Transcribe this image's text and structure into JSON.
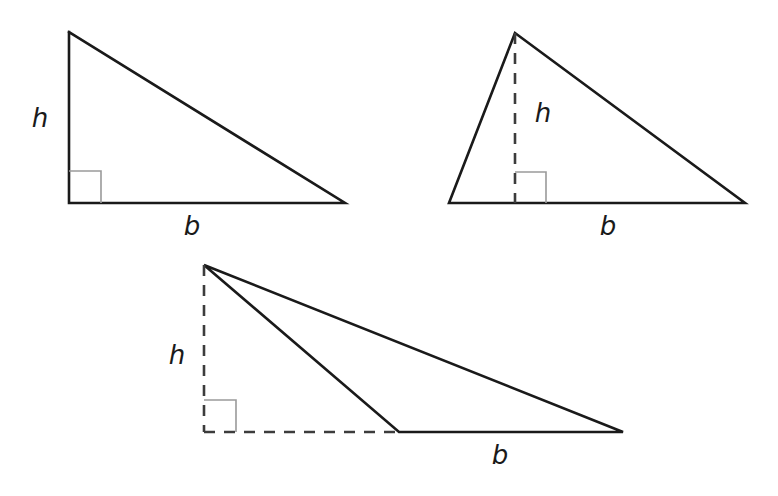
{
  "figure": {
    "background_color": "#ffffff",
    "stroke_color": "#1a1a1a",
    "dashed_color": "#3c3c3c",
    "right_angle_color": "#9a9a9a",
    "stroke_width": 2.6,
    "label_font_size": 26
  },
  "shapes": [
    {
      "id": "triangle-right",
      "name": "right-triangle",
      "type": "triangle",
      "variant": "right",
      "vertices": [
        {
          "x": 69,
          "y": 32
        },
        {
          "x": 69,
          "y": 203
        },
        {
          "x": 345,
          "y": 203
        }
      ],
      "height_segment": {
        "style": "solid",
        "from": {
          "x": 69,
          "y": 32
        },
        "to": {
          "x": 69,
          "y": 203
        }
      },
      "base_segment": {
        "style": "solid",
        "from": {
          "x": 69,
          "y": 203
        },
        "to": {
          "x": 345,
          "y": 203
        }
      },
      "right_angle_marker": {
        "x": 69,
        "y": 171,
        "size": 32
      },
      "height_label": {
        "text": "h",
        "x": 40,
        "y": 127
      },
      "base_label": {
        "text": "b",
        "x": 192,
        "y": 235
      }
    },
    {
      "id": "triangle-acute",
      "name": "acute-triangle",
      "type": "triangle",
      "variant": "acute",
      "vertices": [
        {
          "x": 515,
          "y": 33
        },
        {
          "x": 449,
          "y": 203
        },
        {
          "x": 745,
          "y": 203
        }
      ],
      "height_segment": {
        "style": "dashed",
        "from": {
          "x": 515,
          "y": 33
        },
        "to": {
          "x": 515,
          "y": 203
        }
      },
      "base_segment": {
        "style": "solid",
        "from": {
          "x": 449,
          "y": 203
        },
        "to": {
          "x": 745,
          "y": 203
        }
      },
      "right_angle_marker": {
        "x": 515,
        "y": 172,
        "size": 31
      },
      "height_label": {
        "text": "h",
        "x": 543,
        "y": 122
      },
      "base_label": {
        "text": "b",
        "x": 608,
        "y": 235
      }
    },
    {
      "id": "triangle-obtuse",
      "name": "obtuse-triangle",
      "type": "triangle",
      "variant": "obtuse",
      "vertices": [
        {
          "x": 204,
          "y": 265
        },
        {
          "x": 399,
          "y": 432
        },
        {
          "x": 623,
          "y": 432
        }
      ],
      "height_segment": {
        "style": "dashed",
        "from": {
          "x": 204,
          "y": 265
        },
        "to": {
          "x": 204,
          "y": 432
        }
      },
      "base_extension_segment": {
        "style": "dashed",
        "from": {
          "x": 204,
          "y": 432
        },
        "to": {
          "x": 399,
          "y": 432
        }
      },
      "base_segment": {
        "style": "solid",
        "from": {
          "x": 399,
          "y": 432
        },
        "to": {
          "x": 623,
          "y": 432
        }
      },
      "right_angle_marker": {
        "x": 204,
        "y": 400,
        "size": 32
      },
      "height_label": {
        "text": "h",
        "x": 177,
        "y": 364
      },
      "base_label": {
        "text": "b",
        "x": 500,
        "y": 464
      }
    }
  ]
}
